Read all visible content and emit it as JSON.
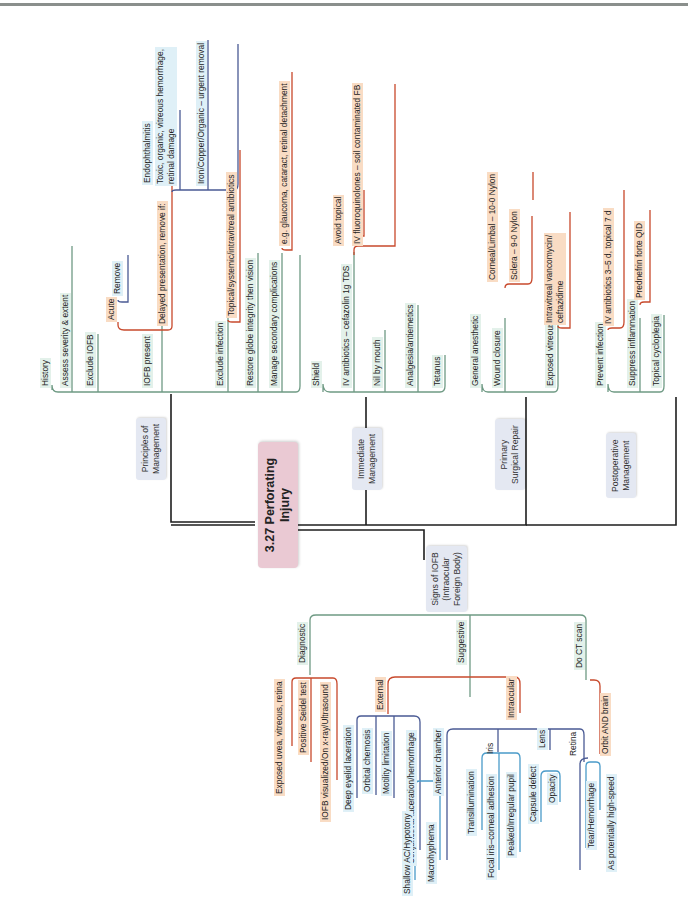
{
  "title": "3.27 Perforating Injury",
  "title_line1": "3.27 Perforating",
  "title_line2": "Injury",
  "colors": {
    "central": "#eac9d3",
    "category": "#e4e8f2",
    "green_line": "#6f9a84",
    "red_line": "#c8492c",
    "navy_line": "#4a5a94",
    "blue_line": "#4a9bc9",
    "trunk": "#1e1e1e"
  },
  "branches": {
    "principles": {
      "label_l1": "Principles of",
      "label_l2": "Management",
      "items": {
        "history": "History",
        "assess": "Assess severity & extent",
        "exclude_iofb": "Exclude IOFB",
        "iofb_present": "IOFB present",
        "acute": "Acute",
        "remove": "Remove",
        "delayed": "Delayed presentation, remove if:",
        "endophthalmitis": "Endophthalmitis",
        "toxic_l1": "Toxic, organic, vitreous hemorrhage,",
        "toxic_l2": "retinal damage",
        "iron": "Iron/Copper/Organic – urgent removal",
        "exclude_infection": "Exclude infection",
        "topical_antibiotics": "Topical/systemic/intravitreal antibiotics",
        "restore": "Restore globe integrity then vision",
        "manage_secondary": "Manage secondary complications",
        "eg_glaucoma": "e.g. glaucoma, cataract, retinal detachment"
      }
    },
    "immediate": {
      "label_l1": "Immediate",
      "label_l2": "Management",
      "items": {
        "shield": "Shield",
        "iv_antibiotics": "IV antibiotics – cefazolin 1g TDS",
        "avoid_topical": "Avoid topical",
        "iv_fluoro": "IV fluoroquinolones – soil contaminated FB",
        "nil_by_mouth": "Nil by mouth",
        "analgesia": "Analgesia/antiemetics",
        "tetanus": "Tetanus"
      }
    },
    "primary": {
      "label_l1": "Primary",
      "label_l2": "Surgical Repair",
      "items": {
        "general_anesthetic": "General anesthetic",
        "wound_closure": "Wound closure",
        "corneal": "Corneal/Limbal – 10-0 Nylon",
        "sclera": "Sclera – 9-0 Nylon",
        "exposed_vitreous": "Exposed vitreous",
        "intravitreal_l1": "Intravitreal vancomycin/",
        "intravitreal_l2": "ceftazidime"
      }
    },
    "postoperative": {
      "label_l1": "Postoperative",
      "label_l2": "Management",
      "items": {
        "prevent_infection": "Prevent infection",
        "iv_antibiotics_3_5": "IV antibiotics 3–5 d, topical 7 d",
        "suppress_inflammation": "Suppress inflammation",
        "prednefrin": "Prednefrin forte QID",
        "topical_cycloplegia": "Topical cycloplegia"
      }
    },
    "signs": {
      "label_l1": "Signs of IOFB",
      "label_l2": "(Intraocular",
      "label_l3": "Foreign Body)",
      "items": {
        "diagnostic": "Diagnostic",
        "exposed_uvea": "Exposed uvea, vitreous, retina",
        "seidel": "Positive Seidel test",
        "iofb_visualized": "IOFB visualized/On x-ray/Ultrasound",
        "suggestive": "Suggestive",
        "external": "External",
        "deep_eyelid": "Deep eyelid laceration",
        "orbital_chemosis": "Orbital chemosis",
        "motility": "Motility limitation",
        "conjunctival": "Conjunctival laceration/hemorrhage",
        "intraocular": "Intraocular",
        "anterior_chamber": "Anterior chamber",
        "shallow_ac": "Shallow AC/Hypotony",
        "macrohyphema": "Macrohyphema",
        "iris": "Iris",
        "transillumination": "Transillumination",
        "focal_iris": "Focal iris–corneal adhesion",
        "peaked_pupil": "Peaked/Irregular pupil",
        "lens": "Lens",
        "capsule_defect": "Capsule defect",
        "opacity": "Opacity",
        "retina": "Retina",
        "tear_hemorrhage": "Tear/Hemorrhage",
        "do_ct": "Do CT scan",
        "orbit_brain": "Orbit AND brain",
        "high_speed": "As potentially high-speed"
      }
    }
  }
}
